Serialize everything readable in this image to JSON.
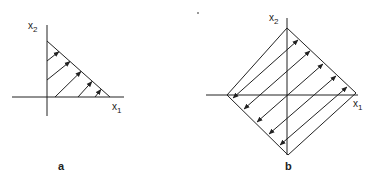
{
  "panels": [
    {
      "id": "a",
      "label": "a",
      "x_axis_label": "x",
      "x_axis_sub": "1",
      "y_axis_label": "x",
      "y_axis_sub": "2",
      "shape": "triangle",
      "arrow_direction": "up-right toward hypotenuse"
    },
    {
      "id": "b",
      "label": "b",
      "x_axis_label": "x",
      "x_axis_sub": "1",
      "y_axis_label": "x",
      "y_axis_sub": "2",
      "shape": "diamond",
      "arrow_direction": "bidirectional toward both edges"
    }
  ],
  "colors": {
    "stroke": "#222222",
    "background": "#ffffff"
  }
}
